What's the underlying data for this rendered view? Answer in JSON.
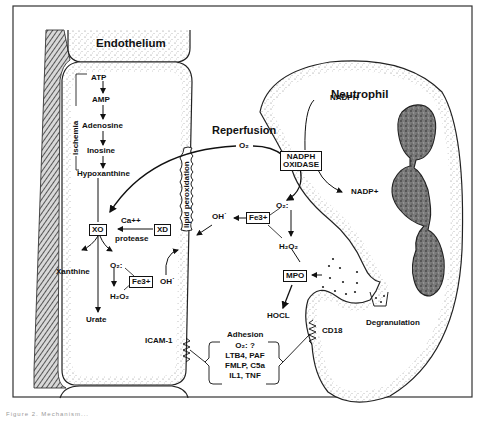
{
  "figure": {
    "regions": {
      "endothelium": "Endothelium",
      "neutrophil": "Neutrophil",
      "reperfusion": "Reperfusion"
    },
    "ischemia_bracket_label": "Ischemia",
    "purine_pathway": [
      "ATP",
      "AMP",
      "Adenosine",
      "Inosine",
      "Hypoxanthine"
    ],
    "endothelial_enzymes": {
      "xo": "XO",
      "xd": "XD",
      "conversion_top": "Ca++",
      "conversion_bottom": "protease",
      "fe3_left": "Fe3+"
    },
    "endothelial_products": {
      "xanthine": "Xanthine",
      "urate": "Urate",
      "superoxide_left": "O₂:",
      "h2o2_left": "H₂O₂",
      "oh_left": "OH˙"
    },
    "membrane_label": "lipid peroxidation",
    "reperfusion_o2": "O₂",
    "neutrophil_pathway": {
      "nadph": "NADPH",
      "nadph_oxidase_line1": "NADPH",
      "nadph_oxidase_line2": "OXIDASE",
      "nadp": "NADP+",
      "superoxide_right": "O₂:",
      "fe3_right": "Fe3+",
      "oh_right": "OH˙",
      "h2o2_right": "H₂O₂",
      "mpo": "MPO",
      "hocl": "HOCL",
      "degranulation": "Degranulation"
    },
    "adhesion": {
      "title": "Adhesion",
      "lines": [
        "O₂: ?",
        "LTB4, PAF",
        "FMLP, C5a",
        "IL1, TNF"
      ],
      "endothelial_receptor": "ICAM-1",
      "neutrophil_receptor": "CD18"
    },
    "caption_fragment": "Figure 2. Mechanism..."
  },
  "colors": {
    "ink": "#111111",
    "stipple": "#9a9a9a",
    "nucleus": "#6f6f6f",
    "background": "#ffffff"
  }
}
